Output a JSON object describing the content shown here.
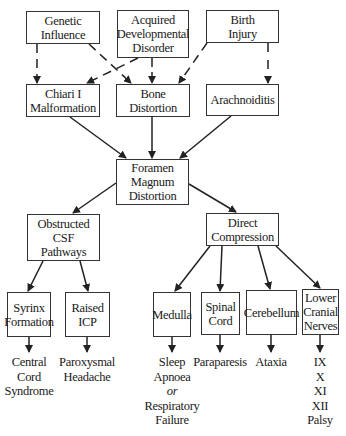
{
  "nodes": {
    "genetic": {
      "lines": [
        "Genetic",
        "Influence"
      ]
    },
    "acquired": {
      "lines": [
        "Acquired",
        "Developmental",
        "Disorder"
      ]
    },
    "birth": {
      "lines": [
        "Birth",
        "Injury"
      ]
    },
    "chiari": {
      "lines": [
        "Chiari I",
        "Malformation"
      ]
    },
    "bone": {
      "lines": [
        "Bone",
        "Distortion"
      ]
    },
    "arachnoiditis": {
      "lines": [
        "Arachnoiditis"
      ]
    },
    "foramen": {
      "lines": [
        "Foramen",
        "Magnum",
        "Distortion"
      ]
    },
    "obstructed": {
      "lines": [
        "Obstructed",
        "CSF",
        "Pathways"
      ]
    },
    "direct": {
      "lines": [
        "Direct",
        "Compression"
      ]
    },
    "syrinx": {
      "lines": [
        "Syrinx",
        "Formation"
      ]
    },
    "icp": {
      "lines": [
        "Raised",
        "ICP"
      ]
    },
    "medulla": {
      "lines": [
        "Medulla"
      ]
    },
    "spinal": {
      "lines": [
        "Spinal",
        "Cord"
      ]
    },
    "cerebellum": {
      "lines": [
        "Cerebellum"
      ]
    },
    "cranial": {
      "lines": [
        "Lower",
        "Cranial",
        "Nerves"
      ]
    }
  },
  "outcomes": {
    "central": {
      "lines": [
        "Central",
        "Cord",
        "Syndrome"
      ]
    },
    "headache": {
      "lines": [
        "Paroxysmal",
        "Headache"
      ]
    },
    "sleep": {
      "lines": [
        "Sleep",
        "Apnoea",
        "or",
        "Respiratory",
        "Failure"
      ]
    },
    "paraparesis": {
      "lines": [
        "Paraparesis"
      ]
    },
    "ataxia": {
      "lines": [
        "Ataxia"
      ]
    },
    "palsy": {
      "lines": [
        "IX",
        "X",
        "XI",
        "XII",
        "Palsy"
      ]
    }
  },
  "edges": [
    {
      "from": "genetic",
      "to": "chiari",
      "style": "dashed"
    },
    {
      "from": "genetic",
      "to": "bone",
      "style": "dashed"
    },
    {
      "from": "acquired",
      "to": "chiari",
      "style": "dashed"
    },
    {
      "from": "acquired",
      "to": "bone",
      "style": "dashed"
    },
    {
      "from": "birth",
      "to": "bone",
      "style": "dashed"
    },
    {
      "from": "birth",
      "to": "arachnoiditis",
      "style": "dashed"
    },
    {
      "from": "chiari",
      "to": "foramen",
      "style": "solid"
    },
    {
      "from": "bone",
      "to": "foramen",
      "style": "solid"
    },
    {
      "from": "arachnoiditis",
      "to": "foramen",
      "style": "solid"
    },
    {
      "from": "foramen",
      "to": "obstructed",
      "style": "solid"
    },
    {
      "from": "foramen",
      "to": "direct",
      "style": "solid"
    },
    {
      "from": "obstructed",
      "to": "syrinx",
      "style": "solid"
    },
    {
      "from": "obstructed",
      "to": "icp",
      "style": "solid"
    },
    {
      "from": "direct",
      "to": "medulla",
      "style": "solid"
    },
    {
      "from": "direct",
      "to": "spinal",
      "style": "solid"
    },
    {
      "from": "direct",
      "to": "cerebellum",
      "style": "solid"
    },
    {
      "from": "direct",
      "to": "cranial",
      "style": "solid"
    },
    {
      "from": "syrinx",
      "to": "central",
      "style": "solid"
    },
    {
      "from": "icp",
      "to": "headache",
      "style": "solid"
    },
    {
      "from": "medulla",
      "to": "sleep",
      "style": "solid"
    },
    {
      "from": "spinal",
      "to": "paraparesis",
      "style": "solid"
    },
    {
      "from": "cerebellum",
      "to": "ataxia",
      "style": "solid"
    },
    {
      "from": "cranial",
      "to": "palsy",
      "style": "solid"
    }
  ]
}
